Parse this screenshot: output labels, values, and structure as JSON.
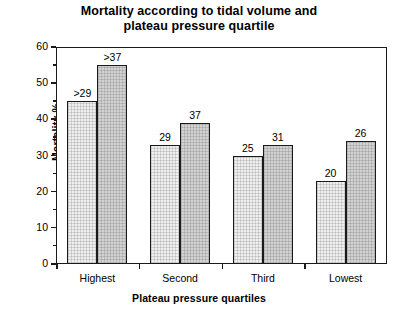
{
  "chart_data": {
    "type": "bar",
    "title": "Mortality according to tidal volume and plateau pressure quartile",
    "title_line1": "Mortality according to tidal volume and",
    "title_line2": "plateau pressure quartile",
    "xlabel": "Plateau pressure quartiles",
    "ylabel": "Mortality %",
    "categories": [
      "Highest",
      "Second",
      "Third",
      "Lowest"
    ],
    "ylim": [
      0,
      60
    ],
    "yticks": [
      0,
      10,
      20,
      30,
      40,
      50,
      60
    ],
    "ytick_labels": [
      "0",
      "10",
      "20",
      "30",
      "40",
      "50",
      "60"
    ],
    "yminor_ticks": [
      5,
      15,
      25,
      35,
      45,
      55
    ],
    "grid": false,
    "legend": "none",
    "series": [
      {
        "name": "Higher tidal volume",
        "fill": "light",
        "values": [
          45,
          33,
          30,
          23
        ],
        "point_labels": [
          ">29",
          "29",
          "25",
          "20"
        ]
      },
      {
        "name": "Lower tidal volume",
        "fill": "dark",
        "values": [
          55,
          39,
          33,
          34
        ],
        "point_labels": [
          ">37",
          "37",
          "31",
          "26"
        ]
      }
    ]
  },
  "colors": {
    "light_bar": "#efefef",
    "dark_bar": "#d2d2d2",
    "axis": "#1a1a1a",
    "background": "#ffffff"
  }
}
